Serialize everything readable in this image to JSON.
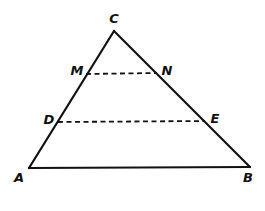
{
  "diagram": {
    "type": "geometry-triangle",
    "stroke_color": "#111111",
    "background": "#ffffff",
    "points": {
      "C": {
        "label": "C",
        "x": 114,
        "y": 31,
        "lx": 114,
        "ly": 23
      },
      "A": {
        "label": "A",
        "x": 29,
        "y": 168,
        "lx": 19,
        "ly": 182
      },
      "B": {
        "label": "B",
        "x": 250,
        "y": 167,
        "lx": 248,
        "ly": 182
      },
      "M": {
        "label": "M",
        "x": 86,
        "y": 74,
        "lx": 77,
        "ly": 75
      },
      "N": {
        "label": "N",
        "x": 157,
        "y": 73,
        "lx": 167,
        "ly": 75
      },
      "D": {
        "label": "D",
        "x": 58,
        "y": 122,
        "lx": 49,
        "ly": 124
      },
      "E": {
        "label": "E",
        "x": 205,
        "y": 121,
        "lx": 215,
        "ly": 123
      }
    },
    "solid_segments": [
      {
        "name": "side-CA",
        "from": "C",
        "to": "A"
      },
      {
        "name": "side-CB",
        "from": "C",
        "to": "B"
      },
      {
        "name": "side-AB",
        "from": "A",
        "to": "B"
      }
    ],
    "dashed_segments": [
      {
        "name": "segment-MN",
        "from": "M",
        "to": "N"
      },
      {
        "name": "segment-DE",
        "from": "D",
        "to": "E"
      }
    ]
  }
}
